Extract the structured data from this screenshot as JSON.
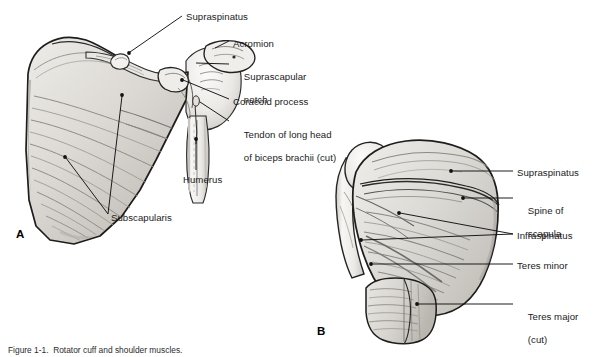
{
  "figure": {
    "panel_letters": [
      {
        "id": "panel-a",
        "text": "A",
        "x": 16,
        "y": 228
      },
      {
        "id": "panel-b",
        "text": "B",
        "x": 317,
        "y": 325
      }
    ],
    "caption": "Figure 1-1.  Rotator cuff and shoulder muscles.",
    "caption_visible": false
  },
  "panel_a": {
    "name": "Anterior view of scapula and humerus",
    "labels": [
      {
        "id": "supraspinatus",
        "lines": [
          "Supraspinatus"
        ],
        "x": 186,
        "y": 11
      },
      {
        "id": "acromion",
        "lines": [
          "Acromion"
        ],
        "x": 233,
        "y": 38
      },
      {
        "id": "suprascapular-notch",
        "lines": [
          "Suprascapular",
          "notch"
        ],
        "x": 233,
        "y": 60
      },
      {
        "id": "coracoid-process",
        "lines": [
          "Coracoid process"
        ],
        "x": 233,
        "y": 96
      },
      {
        "id": "tendon-biceps",
        "lines": [
          "Tendon of long head",
          "of biceps brachii (cut)"
        ],
        "x": 233,
        "y": 118
      },
      {
        "id": "humerus",
        "lines": [
          "Humerus"
        ],
        "x": 183,
        "y": 174
      },
      {
        "id": "subscapularis",
        "lines": [
          "Subscapularis"
        ],
        "x": 111,
        "y": 212
      }
    ]
  },
  "panel_b": {
    "name": "Posterior view of scapula and humerus",
    "labels": [
      {
        "id": "supraspinatus-b",
        "lines": [
          "Supraspinatus"
        ],
        "x": 517,
        "y": 167
      },
      {
        "id": "spine-of-scapula",
        "lines": [
          "Spine of",
          "scapula"
        ],
        "x": 517,
        "y": 194
      },
      {
        "id": "infraspinatus",
        "lines": [
          "Infraspinatus"
        ],
        "x": 517,
        "y": 230
      },
      {
        "id": "teres-minor",
        "lines": [
          "Teres minor"
        ],
        "x": 517,
        "y": 260
      },
      {
        "id": "teres-major",
        "lines": [
          "Teres major",
          "(cut)"
        ],
        "x": 517,
        "y": 300
      }
    ]
  },
  "colors": {
    "ink": "#1a1a1a",
    "outline": "#2b2b2b",
    "bone_light": "#f1f0ee",
    "bone_mid": "#dedcd8",
    "muscle_light": "#e4e2de",
    "muscle_mid": "#cfcdc8",
    "muscle_dark": "#b3b0aa",
    "shadow": "#8e8b85",
    "background": "#ffffff"
  }
}
